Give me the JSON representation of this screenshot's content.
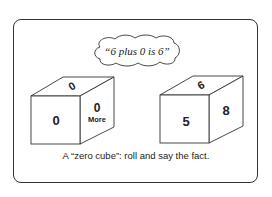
{
  "speech_bubble": {
    "text": "“6 plus 0 is 6”"
  },
  "cubes": [
    {
      "front": "0",
      "top": "0",
      "side": "0",
      "side_sub": "More"
    },
    {
      "front": "5",
      "top": "6",
      "side": "8"
    }
  ],
  "caption": "A “zero cube”:  roll and say the fact.",
  "colors": {
    "ink": "#2a2a2a",
    "background": "#ffffff"
  }
}
